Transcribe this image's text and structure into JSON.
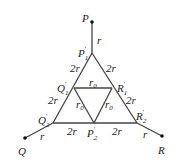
{
  "diagram": {
    "nodes": {
      "P": {
        "label": "P",
        "x": 92,
        "y": 22
      },
      "Q": {
        "label": "Q",
        "x": 25,
        "y": 138
      },
      "R": {
        "label": "R",
        "x": 162,
        "y": 136
      },
      "P1p": {
        "label": "P",
        "sub": "1",
        "prime": "′",
        "x": 92,
        "y": 53
      },
      "Q1p": {
        "label": "Q",
        "sub": "1",
        "prime": "′",
        "x": 74,
        "y": 95
      },
      "R1p": {
        "label": "R",
        "sub": "1",
        "prime": "′",
        "x": 112,
        "y": 95
      },
      "Q2p": {
        "label": "Q",
        "sub": "2",
        "prime": "′",
        "x": 53,
        "y": 123
      },
      "P2p": {
        "label": "P",
        "sub": "2",
        "prime": "′",
        "x": 94,
        "y": 123
      },
      "R2p": {
        "label": "R",
        "sub": "2",
        "prime": "′",
        "x": 137,
        "y": 123
      }
    },
    "edge_labels": {
      "P_P1": "r",
      "P1_Q1": "2r",
      "P1_R1": "2r",
      "Q1_R1": "r",
      "Q1_R1_sub": "0",
      "Q1_P2": "r",
      "Q1_P2_sub": "0",
      "R1_P2": "r",
      "R1_P2_sub": "0",
      "Q1_Q2": "2r",
      "R1_R2": "2r",
      "Q2_P2": "2r",
      "P2_R2": "2r",
      "Q_Q2": "r",
      "R_R2": "r"
    }
  }
}
